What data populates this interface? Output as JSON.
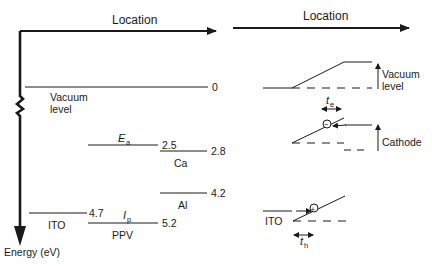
{
  "left_panel": {
    "x_axis_label": "Location",
    "y_axis_label": "Energy (eV)",
    "levels": [
      {
        "name": "Vacuum level",
        "value": "0"
      },
      {
        "name": "E_a",
        "symbol": "E",
        "subscript": "a",
        "value": "2.5"
      },
      {
        "name": "Ca",
        "value": "2.8"
      },
      {
        "name": "Al",
        "value": "4.2"
      },
      {
        "name": "ITO",
        "value": "4.7"
      },
      {
        "name": "I_p",
        "symbol": "I",
        "subscript": "p",
        "value": "5.2"
      },
      {
        "name": "PPV"
      }
    ],
    "labels": {
      "vacuum_line1": "Vacuum",
      "vacuum_line2": "level",
      "ea_symbol": "E",
      "ea_sub": "a",
      "ea_value": "2.5",
      "ca_label": "Ca",
      "ca_value": "2.8",
      "al_label": "Al",
      "al_value": "4.2",
      "ito_label": "ITO",
      "ito_value": "4.7",
      "ip_symbol": "I",
      "ip_sub": "p",
      "ip_value": "5.2",
      "ppv_label": "PPV"
    }
  },
  "right_panel": {
    "x_axis_label": "Location",
    "vacuum_line1": "Vacuum",
    "vacuum_line2": "level",
    "te_symbol": "t",
    "te_sub": "e",
    "cathode_label": "Cathode",
    "ito_label": "ITO",
    "th_symbol": "t",
    "th_sub": "h",
    "electron_symbol": "−",
    "hole_symbol": "+"
  }
}
